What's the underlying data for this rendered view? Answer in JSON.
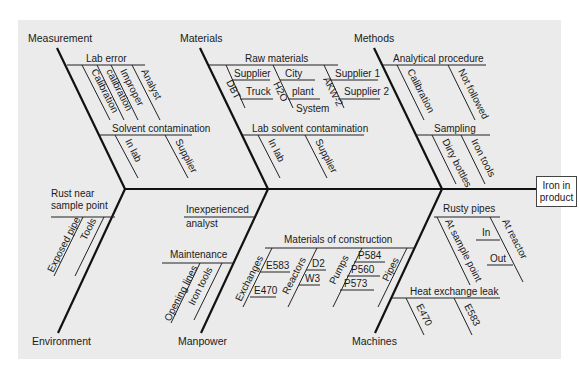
{
  "diagram": {
    "type": "fishbone",
    "effect": {
      "line1": "Iron in",
      "line2": "product"
    },
    "categories": {
      "measurement": {
        "label": "Measurement",
        "causes": [
          {
            "label": "Lab error",
            "subcauses": [
              "Calibration",
              "calibration",
              "Improper",
              "Analyst"
            ]
          },
          {
            "label": "Solvent contamination",
            "subcauses": [
              "In lab",
              "Supplier"
            ]
          }
        ]
      },
      "materials": {
        "label": "Materials",
        "causes": [
          {
            "label": "Raw materials",
            "subcauses": [
              "DBT",
              "Supplier",
              "Truck",
              "H2O",
              "City",
              "plant",
              "System",
              "AKW-2",
              "Supplier 1",
              "Supplier 2"
            ]
          },
          {
            "label": "Lab solvent contamination",
            "subcauses": [
              "In lab",
              "Supplier"
            ]
          }
        ]
      },
      "methods": {
        "label": "Methods",
        "causes": [
          {
            "label": "Analytical procedure",
            "subcauses": [
              "Calibration",
              "Not followed"
            ]
          },
          {
            "label": "Sampling",
            "subcauses": [
              "Dirty bottles",
              "Iron tools"
            ]
          }
        ]
      },
      "environment": {
        "label": "Environment",
        "causes": [
          {
            "label_line1": "Rust near",
            "label_line2": "sample point",
            "subcauses": [
              "Exposed pipe",
              "Tools"
            ]
          }
        ]
      },
      "manpower": {
        "label": "Manpower",
        "causes": [
          {
            "label_line1": "Inexperienced",
            "label_line2": "analyst"
          },
          {
            "label": "Maintenance",
            "subcauses": [
              "Opening lines",
              "Iron tools"
            ]
          }
        ]
      },
      "machines": {
        "label": "Machines",
        "causes": [
          {
            "label": "Materials of construction",
            "subcauses": [
              "Exchanges",
              "E583",
              "E470",
              "Reactors",
              "D2",
              "W3",
              "Pumps",
              "P584",
              "P560",
              "P573",
              "Pipes"
            ]
          },
          {
            "label": "Rusty pipes",
            "subcauses": [
              "At sample point",
              "At reactor",
              "In",
              "Out"
            ]
          },
          {
            "label": "Heat exchange leak",
            "subcauses": [
              "E470",
              "E583"
            ]
          }
        ]
      }
    }
  }
}
